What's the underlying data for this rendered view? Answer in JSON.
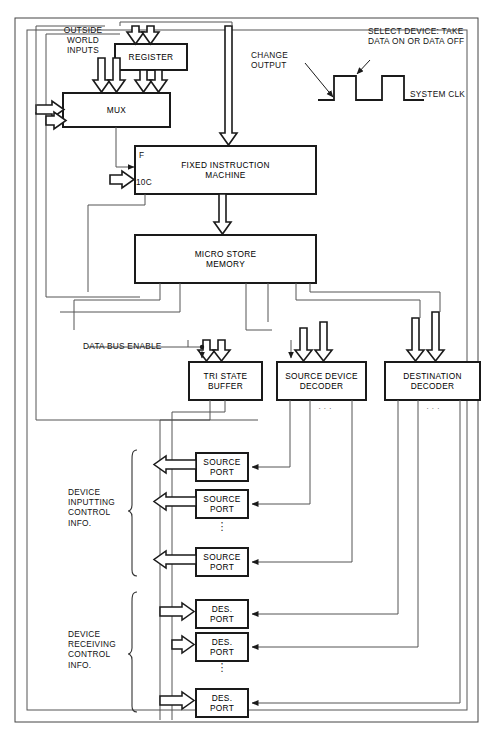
{
  "diagram": {
    "blocks": [
      {
        "id": "register",
        "label": "REGISTER",
        "x": 115,
        "y": 44,
        "w": 72,
        "h": 26
      },
      {
        "id": "mux",
        "label": "MUX",
        "x": 63,
        "y": 93,
        "w": 107,
        "h": 34
      },
      {
        "id": "fixed-instruction-machine",
        "label": "FIXED INSTRUCTION\nMACHINE",
        "x": 135,
        "y": 146,
        "w": 181,
        "h": 48
      },
      {
        "id": "micro-store-memory",
        "label": "MICRO STORE\nMEMORY",
        "x": 135,
        "y": 235,
        "w": 181,
        "h": 48
      },
      {
        "id": "tri-state-buffer",
        "label": "TRI STATE\nBUFFER",
        "x": 189,
        "y": 362,
        "w": 73,
        "h": 38
      },
      {
        "id": "source-device-decoder",
        "label": "SOURCE DEVICE\nDECODER",
        "x": 277,
        "y": 362,
        "w": 89,
        "h": 38
      },
      {
        "id": "destination-decoder",
        "label": "DESTINATION\nDECODER",
        "x": 385,
        "y": 362,
        "w": 95,
        "h": 38
      }
    ],
    "source_ports": [
      {
        "label": "SOURCE\nPORT",
        "x": 196,
        "y": 453,
        "w": 52,
        "h": 28
      },
      {
        "label": "SOURCE\nPORT",
        "x": 196,
        "y": 490,
        "w": 52,
        "h": 28
      },
      {
        "label": "SOURCE\nPORT",
        "x": 196,
        "y": 548,
        "w": 52,
        "h": 28
      }
    ],
    "des_ports": [
      {
        "label": "DES.\nPORT",
        "x": 196,
        "y": 600,
        "w": 52,
        "h": 28
      },
      {
        "label": "DES.\nPORT",
        "x": 196,
        "y": 633,
        "w": 52,
        "h": 28
      },
      {
        "label": "DES.\nPORT",
        "x": 196,
        "y": 689,
        "w": 52,
        "h": 28
      }
    ],
    "labels": {
      "outside_world_inputs": "OUTSIDE\nWORLD\nINPUTS",
      "f_input": "F",
      "ioc_input": "10C",
      "data_bus_enable": "DATA BUS ENABLE",
      "device_inputting": "DEVICE\nINPUTTING\nCONTROL\nINFO.",
      "device_receiving": "DEVICE\nRECEIVING\nCONTROL\nINFO.",
      "ellipsis_horizontal": "· · ·",
      "ellipsis_vertical": "⋮"
    },
    "timing": {
      "change_output": "CHANGE\nOUTPUT",
      "select_device": "SELECT DEVICE: TAKE\nDATA ON OR DATA OFF",
      "system_clk": "SYSTEM CLK"
    },
    "colors": {
      "line": "#1a1a1a",
      "thin_line": "#555555",
      "background": "#ffffff",
      "text": "#111111"
    }
  }
}
